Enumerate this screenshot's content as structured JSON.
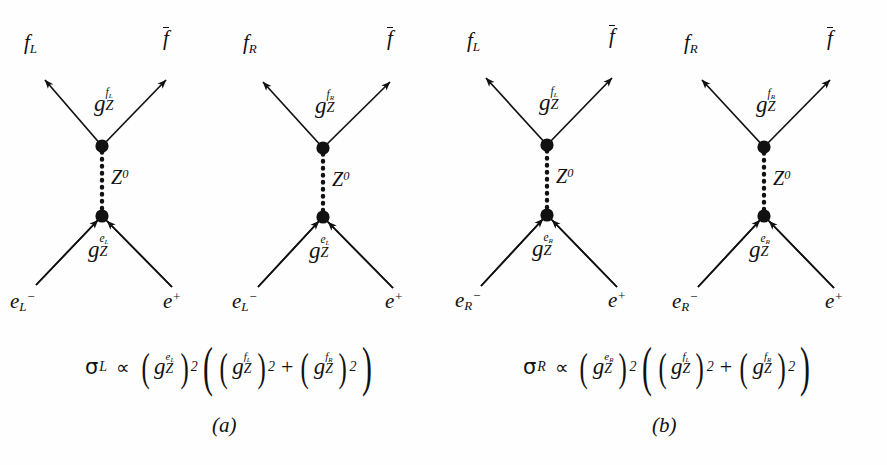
{
  "figure": {
    "type": "feynman-diagram-set",
    "background_color": "#fefefe",
    "ink_color": "#111111",
    "panels": [
      {
        "id": "a",
        "label": "(a)",
        "diagrams": [
          {
            "id": "a1",
            "outgoing_left": "f",
            "outgoing_left_sub": "L",
            "outgoing_right": "f",
            "outgoing_right_bar": true,
            "upper_coupling_base": "g",
            "upper_coupling_sub": "Z",
            "upper_coupling_sup": "f",
            "upper_coupling_sup_sub": "L",
            "propagator": "Z",
            "propagator_sup": "0",
            "incoming_left": "e",
            "incoming_left_sub": "L",
            "incoming_left_sup": "−",
            "incoming_right": "e",
            "incoming_right_sup": "+",
            "lower_coupling_base": "g",
            "lower_coupling_sub": "Z",
            "lower_coupling_sup": "e",
            "lower_coupling_sup_sub": "L"
          },
          {
            "id": "a2",
            "outgoing_left": "f",
            "outgoing_left_sub": "R",
            "outgoing_right": "f",
            "outgoing_right_bar": true,
            "upper_coupling_base": "g",
            "upper_coupling_sub": "Z",
            "upper_coupling_sup": "f",
            "upper_coupling_sup_sub": "R",
            "propagator": "Z",
            "propagator_sup": "0",
            "incoming_left": "e",
            "incoming_left_sub": "L",
            "incoming_left_sup": "−",
            "incoming_right": "e",
            "incoming_right_sup": "+",
            "lower_coupling_base": "g",
            "lower_coupling_sub": "Z",
            "lower_coupling_sup": "e",
            "lower_coupling_sup_sub": "L"
          }
        ],
        "formula": {
          "lhs_symbol": "σ",
          "lhs_sub": "L",
          "relation": "∝",
          "factor1_base": "g",
          "factor1_sub": "Z",
          "factor1_sup": "e",
          "factor1_sup_sub": "L",
          "factor1_power": "2",
          "term1_base": "g",
          "term1_sub": "Z",
          "term1_sup": "f",
          "term1_sup_sub": "L",
          "term1_power": "2",
          "operator": "+",
          "term2_base": "g",
          "term2_sub": "Z",
          "term2_sup": "f",
          "term2_sup_sub": "R",
          "term2_power": "2"
        }
      },
      {
        "id": "b",
        "label": "(b)",
        "diagrams": [
          {
            "id": "b1",
            "outgoing_left": "f",
            "outgoing_left_sub": "L",
            "outgoing_right": "f",
            "outgoing_right_bar": true,
            "upper_coupling_base": "g",
            "upper_coupling_sub": "Z",
            "upper_coupling_sup": "f",
            "upper_coupling_sup_sub": "L",
            "propagator": "Z",
            "propagator_sup": "0",
            "incoming_left": "e",
            "incoming_left_sub": "R",
            "incoming_left_sup": "−",
            "incoming_right": "e",
            "incoming_right_sup": "+",
            "lower_coupling_base": "g",
            "lower_coupling_sub": "Z",
            "lower_coupling_sup": "e",
            "lower_coupling_sup_sub": "R"
          },
          {
            "id": "b2",
            "outgoing_left": "f",
            "outgoing_left_sub": "R",
            "outgoing_right": "f",
            "outgoing_right_bar": true,
            "upper_coupling_base": "g",
            "upper_coupling_sub": "Z",
            "upper_coupling_sup": "f",
            "upper_coupling_sup_sub": "R",
            "propagator": "Z",
            "propagator_sup": "0",
            "incoming_left": "e",
            "incoming_left_sub": "R",
            "incoming_left_sup": "−",
            "incoming_right": "e",
            "incoming_right_sup": "+",
            "lower_coupling_base": "g",
            "lower_coupling_sub": "Z",
            "lower_coupling_sup": "e",
            "lower_coupling_sup_sub": "R"
          }
        ],
        "formula": {
          "lhs_symbol": "σ",
          "lhs_sub": "R",
          "relation": "∝",
          "factor1_base": "g",
          "factor1_sub": "Z",
          "factor1_sup": "e",
          "factor1_sup_sub": "R",
          "factor1_power": "2",
          "term1_base": "g",
          "term1_sub": "Z",
          "term1_sup": "f",
          "term1_sup_sub": "L",
          "term1_power": "2",
          "operator": "+",
          "term2_base": "g",
          "term2_sub": "Z",
          "term2_sup": "f",
          "term2_sup_sub": "R",
          "term2_power": "2"
        }
      }
    ]
  }
}
